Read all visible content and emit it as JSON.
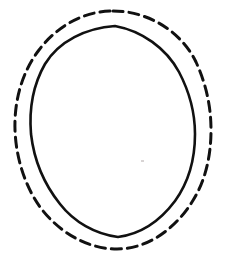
{
  "document": {
    "title": "Concentric Ovals Diagram",
    "background_color": "#ffffff",
    "width": 225,
    "height": 260,
    "style": "hand-drawn line art",
    "text_content": "",
    "labels": []
  },
  "chart_data": {
    "type": "diagram",
    "title": "",
    "subtitle": "",
    "xlabel": "",
    "ylabel": "",
    "legend": [],
    "annotations": [],
    "shapes": [
      {
        "name": "outer-dashed-oval",
        "shape": "oval",
        "stroke_style": "dashed",
        "stroke_color": "#111111",
        "stroke_width": 3,
        "dash_length": 10,
        "gap_length": 6,
        "fill": "none",
        "center_x": 113,
        "center_y": 130,
        "radius_x": 98,
        "radius_y": 119,
        "bounds": {
          "left": 15,
          "top": 11,
          "right": 211,
          "bottom": 249
        }
      },
      {
        "name": "inner-solid-oval",
        "shape": "oval",
        "stroke_style": "solid",
        "stroke_color": "#111111",
        "stroke_width": 2.6,
        "fill": "none",
        "center_x": 112,
        "center_y": 131,
        "radius_x": 83,
        "radius_y": 105,
        "bounds": {
          "left": 29,
          "top": 26,
          "right": 195,
          "bottom": 237
        }
      }
    ],
    "marks": [
      {
        "name": "gray-speck",
        "shape": "speck",
        "color": "#d8d4d4",
        "x": 141,
        "y": 160,
        "width": 3,
        "height": 2
      }
    ]
  }
}
